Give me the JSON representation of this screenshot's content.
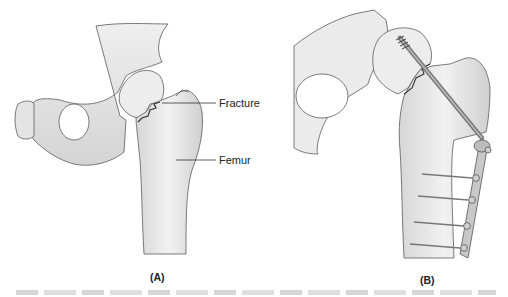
{
  "figure": {
    "panels": [
      {
        "id": "A",
        "label": "(A)",
        "annotations": [
          {
            "text": "Fracture",
            "target": "femoral neck fracture line"
          },
          {
            "text": "Femur",
            "target": "femur shaft"
          }
        ]
      },
      {
        "id": "B",
        "label": "(B)",
        "annotations": []
      }
    ],
    "colors": {
      "bone_fill": "#ececec",
      "bone_shadow": "#c9c9c9",
      "outline": "#555555",
      "hardware": "#8a8a8a",
      "label_text": "#222222"
    }
  }
}
